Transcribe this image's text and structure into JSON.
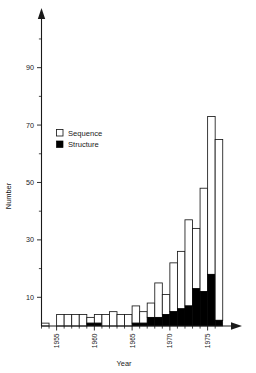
{
  "chart_data": {
    "type": "bar",
    "title": "",
    "xlabel": "Year",
    "ylabel": "Number",
    "stacked": true,
    "grid": false,
    "legend_position": "upper-left-inside",
    "xlim": [
      1952.5,
      1977.0
    ],
    "ylim": [
      0,
      108
    ],
    "y_ticks_major": [
      10,
      30,
      50,
      70,
      90
    ],
    "y_ticks_minor": [
      20,
      40,
      60,
      80,
      100
    ],
    "x_ticks_major": [
      1955,
      1960,
      1965,
      1970,
      1975
    ],
    "x_tick_labels": [
      "1955",
      "1960",
      "1965",
      "1970",
      "1975"
    ],
    "categories": [
      1953,
      1954,
      1955,
      1956,
      1957,
      1958,
      1959,
      1960,
      1961,
      1962,
      1963,
      1964,
      1965,
      1966,
      1967,
      1968,
      1969,
      1970,
      1971,
      1972,
      1973,
      1974,
      1975,
      1976
    ],
    "series": [
      {
        "name": "Sequence",
        "color": "#ffffff",
        "values": [
          1,
          0,
          4,
          4,
          4,
          4,
          2,
          3,
          4,
          5,
          4,
          4,
          6,
          4,
          5,
          12,
          7,
          17,
          20,
          30,
          21,
          36,
          55,
          63
        ]
      },
      {
        "name": "Structure",
        "color": "#000000",
        "values": [
          0,
          0,
          0,
          0,
          0,
          0,
          1,
          1,
          0,
          0,
          0,
          0,
          1,
          1,
          3,
          3,
          4,
          5,
          6,
          7,
          13,
          12,
          18,
          2
        ]
      }
    ],
    "totals": [
      1,
      0,
      4,
      4,
      4,
      4,
      3,
      4,
      4,
      5,
      4,
      4,
      7,
      5,
      8,
      15,
      11,
      22,
      26,
      37,
      34,
      48,
      73,
      65
    ],
    "annotations": []
  },
  "legend": {
    "entries": [
      {
        "label": "Sequence",
        "swatch": "open-square"
      },
      {
        "label": "Structure",
        "swatch": "filled-square"
      }
    ]
  },
  "axes": {
    "y_title": "Number",
    "x_title": "Year"
  }
}
